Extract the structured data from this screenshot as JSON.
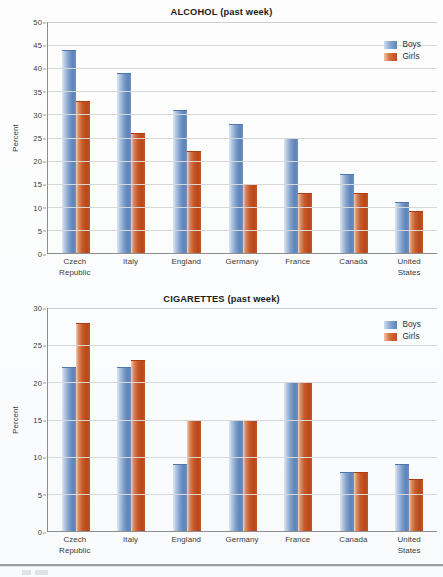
{
  "document": {
    "footer_rule_visible": true
  },
  "legend": {
    "boys_label": "Boys",
    "girls_label": "Girls",
    "boys_color": "#5d83b8",
    "girls_color": "#c85a28"
  },
  "chart_data": [
    {
      "type": "bar",
      "title": "ALCOHOL (past week)",
      "xlabel": "",
      "ylabel": "Percent",
      "ylim": [
        0,
        50
      ],
      "ytick_step": 5,
      "yticks": [
        50,
        45,
        40,
        35,
        30,
        25,
        20,
        15,
        10,
        5,
        0
      ],
      "grid": true,
      "legend_position": "top-right",
      "categories": [
        "Czech Republic",
        "Italy",
        "England",
        "Germany",
        "France",
        "Canada",
        "United States"
      ],
      "category_lines": [
        [
          "Czech",
          "Republic"
        ],
        [
          "Italy"
        ],
        [
          "England"
        ],
        [
          "Germany"
        ],
        [
          "France"
        ],
        [
          "Canada"
        ],
        [
          "United",
          "States"
        ]
      ],
      "series": [
        {
          "name": "Boys",
          "color": "#5d83b8",
          "values": [
            44,
            39,
            31,
            28,
            25,
            17,
            11
          ]
        },
        {
          "name": "Girls",
          "color": "#c85a28",
          "values": [
            33,
            26,
            22,
            15,
            13,
            13,
            9
          ]
        }
      ]
    },
    {
      "type": "bar",
      "title": "CIGARETTES (past week)",
      "xlabel": "",
      "ylabel": "Percent",
      "ylim": [
        0,
        30
      ],
      "ytick_step": 5,
      "yticks": [
        30,
        25,
        20,
        15,
        10,
        5,
        0
      ],
      "grid": true,
      "legend_position": "top-right",
      "categories": [
        "Czech Republic",
        "Italy",
        "England",
        "Germany",
        "France",
        "Canada",
        "United States"
      ],
      "category_lines": [
        [
          "Czech",
          "Republic"
        ],
        [
          "Italy"
        ],
        [
          "England"
        ],
        [
          "Germany"
        ],
        [
          "France"
        ],
        [
          "Canada"
        ],
        [
          "United",
          "States"
        ]
      ],
      "series": [
        {
          "name": "Boys",
          "color": "#5d83b8",
          "values": [
            22,
            22,
            9,
            15,
            20,
            8,
            9
          ]
        },
        {
          "name": "Girls",
          "color": "#c85a28",
          "values": [
            28,
            23,
            15,
            15,
            20,
            8,
            7
          ]
        }
      ]
    }
  ]
}
